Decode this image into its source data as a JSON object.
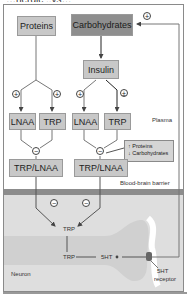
{
  "title_clipped": "…nergic ..ys…",
  "nodes": {
    "proteins": "Proteins",
    "carbohydrates": "Carbohydrates",
    "insulin": "Insulin",
    "lnaa_left": "LNAA",
    "trp_left": "TRP",
    "lnaa_right": "LNAA",
    "trp_right": "TRP",
    "ratio_left": "TRP/LNAA",
    "ratio_right": "TRP/LNAA"
  },
  "labels": {
    "plasma": "Plasma",
    "bbb": "Blood-brain barrier",
    "neuron": "Neuron",
    "trp_brain": "TRP",
    "trp_neuron": "TRP",
    "serotonin": "5HT",
    "receptor_line1": "5HT",
    "receptor_line2": "receptor"
  },
  "note": {
    "line1": "↑ Proteins",
    "line2": "↓ Carbohydrates"
  },
  "signs": {
    "plus": "+",
    "minus": "−",
    "plusminus": "±"
  },
  "colors": {
    "light_box": "#c8c8c8",
    "dark_box": "#8e8e8e",
    "barrier": "#8c8c8c",
    "brain": "#dedede",
    "line": "#666666"
  }
}
